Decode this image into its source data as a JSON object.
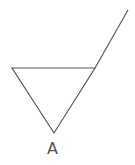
{
  "diagram": {
    "type": "geometry",
    "shapes": {
      "triangle": {
        "vertices": [
          [
            12,
            68
          ],
          [
            95,
            68
          ],
          [
            54,
            133
          ]
        ],
        "stroke": "#5a5a5a"
      },
      "extension_line": {
        "from": [
          95,
          68
        ],
        "to": [
          128,
          10
        ],
        "stroke": "#5a5a5a"
      }
    },
    "labels": {
      "vertex_a": "A"
    }
  }
}
